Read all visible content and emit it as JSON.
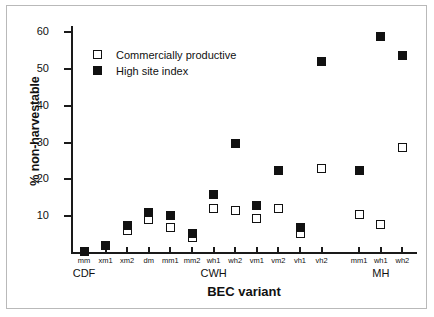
{
  "chart_data": {
    "type": "scatter",
    "title": "",
    "xlabel": "BEC variant",
    "ylabel": "% non-harvestable",
    "ylim": [
      0,
      62
    ],
    "yticks": [
      10,
      20,
      30,
      40,
      50,
      60
    ],
    "grid": false,
    "legend_position": "top-left",
    "categories": [
      "mm",
      "xm1",
      "xm2",
      "dm",
      "mm1",
      "mm2",
      "wh1",
      "wh2",
      "vm1",
      "vm2",
      "vh1",
      "vh2",
      "mm1",
      "wh1",
      "wh2"
    ],
    "groups": [
      {
        "label": "CDF",
        "categories": [
          "mm"
        ]
      },
      {
        "label": "CWH",
        "categories": [
          "xm1",
          "xm2",
          "dm",
          "mm1",
          "mm2",
          "wh1",
          "wh2",
          "vm1",
          "vm2",
          "vh1",
          "vh2"
        ]
      },
      {
        "label": "MH",
        "categories": [
          "mm1",
          "wh1",
          "wh2"
        ]
      }
    ],
    "series": [
      {
        "name": "Commercially productive",
        "marker": "open-square",
        "values": [
          null,
          null,
          6.0,
          9.0,
          7.0,
          4.2,
          12.0,
          11.6,
          9.5,
          12.0,
          5.3,
          23.0,
          10.4,
          7.7,
          28.6
        ]
      },
      {
        "name": "High site index",
        "marker": "filled-square",
        "values": [
          0.5,
          2.0,
          7.5,
          11.1,
          10.3,
          5.3,
          15.8,
          29.7,
          13.0,
          22.4,
          7.0,
          51.9,
          22.3,
          58.7,
          53.5
        ]
      }
    ]
  },
  "legend": {
    "items": [
      {
        "label": "Commercially productive",
        "marker": "open-square"
      },
      {
        "label": "High site index",
        "marker": "filled-square"
      }
    ]
  }
}
